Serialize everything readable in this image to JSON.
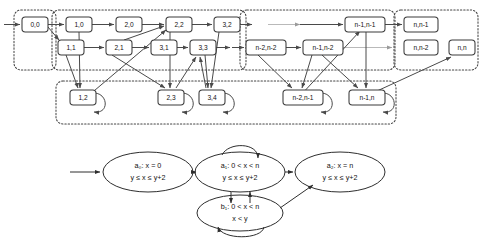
{
  "figure": {
    "panels": [
      "region-graph",
      "timed-automaton"
    ]
  },
  "region_graph": {
    "groups": [
      {
        "id": "g-init",
        "name": "initial-region-group"
      },
      {
        "id": "g-main",
        "name": "main-region-group-left"
      },
      {
        "id": "g-main-r",
        "name": "main-region-group-right"
      },
      {
        "id": "g-final",
        "name": "final-region-group"
      },
      {
        "id": "g-bottom",
        "name": "absorbing-region-group"
      }
    ],
    "nodes": [
      {
        "id": "n00",
        "label": "0,0",
        "x": 22,
        "y": 17,
        "w": 26,
        "h": 15,
        "group": "g-init",
        "selfloop": false
      },
      {
        "id": "n10",
        "label": "1,0",
        "x": 66,
        "y": 17,
        "w": 26,
        "h": 15,
        "group": "g-main",
        "selfloop": false
      },
      {
        "id": "n20",
        "label": "2,0",
        "x": 116,
        "y": 17,
        "w": 26,
        "h": 15,
        "group": "g-main",
        "selfloop": false
      },
      {
        "id": "n22",
        "label": "2,2",
        "x": 166,
        "y": 17,
        "w": 26,
        "h": 15,
        "group": "g-main",
        "selfloop": false
      },
      {
        "id": "n32",
        "label": "3,2",
        "x": 214,
        "y": 17,
        "w": 26,
        "h": 15,
        "group": "g-main",
        "selfloop": false
      },
      {
        "id": "n11",
        "label": "1,1",
        "x": 58,
        "y": 40,
        "w": 26,
        "h": 15,
        "group": "g-main",
        "selfloop": false
      },
      {
        "id": "n21",
        "label": "2,1",
        "x": 106,
        "y": 40,
        "w": 26,
        "h": 15,
        "group": "g-main",
        "selfloop": false
      },
      {
        "id": "n31",
        "label": "3,1",
        "x": 151,
        "y": 40,
        "w": 26,
        "h": 15,
        "group": "g-main",
        "selfloop": false
      },
      {
        "id": "n33",
        "label": "3,3",
        "x": 190,
        "y": 40,
        "w": 26,
        "h": 15,
        "group": "g-main",
        "selfloop": false
      },
      {
        "id": "nn1n1",
        "label": "n-1,n-1",
        "x": 345,
        "y": 17,
        "w": 40,
        "h": 15,
        "group": "g-main-r",
        "selfloop": false
      },
      {
        "id": "nn2n2",
        "label": "n-2,n-2",
        "x": 246,
        "y": 40,
        "w": 40,
        "h": 15,
        "group": "g-main-r",
        "selfloop": false
      },
      {
        "id": "nn1n2",
        "label": "n-1,n-2",
        "x": 303,
        "y": 40,
        "w": 40,
        "h": 15,
        "group": "g-main-r",
        "selfloop": false
      },
      {
        "id": "nnn1",
        "label": "n,n-1",
        "x": 404,
        "y": 17,
        "w": 34,
        "h": 15,
        "group": "g-final",
        "selfloop": false
      },
      {
        "id": "nnn2",
        "label": "n,n-2",
        "x": 404,
        "y": 40,
        "w": 34,
        "h": 15,
        "group": "g-final",
        "selfloop": false
      },
      {
        "id": "nnn",
        "label": "n,n",
        "x": 449,
        "y": 40,
        "w": 26,
        "h": 15,
        "group": "g-final",
        "selfloop": false
      },
      {
        "id": "n12",
        "label": "1,2",
        "x": 70,
        "y": 90,
        "w": 26,
        "h": 15,
        "group": "g-bottom",
        "selfloop": true
      },
      {
        "id": "n23",
        "label": "2,3",
        "x": 158,
        "y": 90,
        "w": 26,
        "h": 15,
        "group": "g-bottom",
        "selfloop": true
      },
      {
        "id": "n34",
        "label": "3,4",
        "x": 199,
        "y": 90,
        "w": 26,
        "h": 15,
        "group": "g-bottom",
        "selfloop": true
      },
      {
        "id": "nn2n1",
        "label": "n-2,n-1",
        "x": 283,
        "y": 90,
        "w": 40,
        "h": 15,
        "group": "g-bottom",
        "selfloop": true
      },
      {
        "id": "nn1n",
        "label": "n-1,n",
        "x": 349,
        "y": 90,
        "w": 36,
        "h": 15,
        "group": "g-bottom",
        "selfloop": true
      }
    ],
    "entry_arrow": "entry into 0,0",
    "continuation_marks": [
      "right of 3,2",
      "right of 3,3",
      "left of n-2,n-2",
      "left of n-1,n-1"
    ]
  },
  "timed_automaton": {
    "states": [
      {
        "id": "a0",
        "name": "a0",
        "line1": "a₀: x = 0",
        "line2": "y ≤ x ≤ y+2",
        "cx": 148,
        "cy": 172,
        "rx": 45,
        "ry": 20
      },
      {
        "id": "a1",
        "name": "a1",
        "line1": "a₁: 0 < x < n",
        "line2": "y ≤ x ≤ y+2",
        "cx": 240,
        "cy": 172,
        "rx": 45,
        "ry": 20
      },
      {
        "id": "b1",
        "name": "b1",
        "line1": "b₁: 0 < x < n",
        "line2": "x < y",
        "cx": 240,
        "cy": 213,
        "rx": 43,
        "ry": 18
      },
      {
        "id": "a2",
        "name": "a2",
        "line1": "a₂: x = n",
        "line2": "y ≤ x ≤ y+2",
        "cx": 340,
        "cy": 172,
        "rx": 45,
        "ry": 20
      }
    ],
    "transitions": [
      {
        "from": "start",
        "to": "a0"
      },
      {
        "from": "a0",
        "to": "a1"
      },
      {
        "from": "a1",
        "to": "a1",
        "kind": "self-loop-top"
      },
      {
        "from": "a1",
        "to": "b1"
      },
      {
        "from": "b1",
        "to": "a1"
      },
      {
        "from": "b1",
        "to": "b1",
        "kind": "self-loop-bottom"
      },
      {
        "from": "a1",
        "to": "a2"
      },
      {
        "from": "b1",
        "to": "a2"
      }
    ]
  }
}
